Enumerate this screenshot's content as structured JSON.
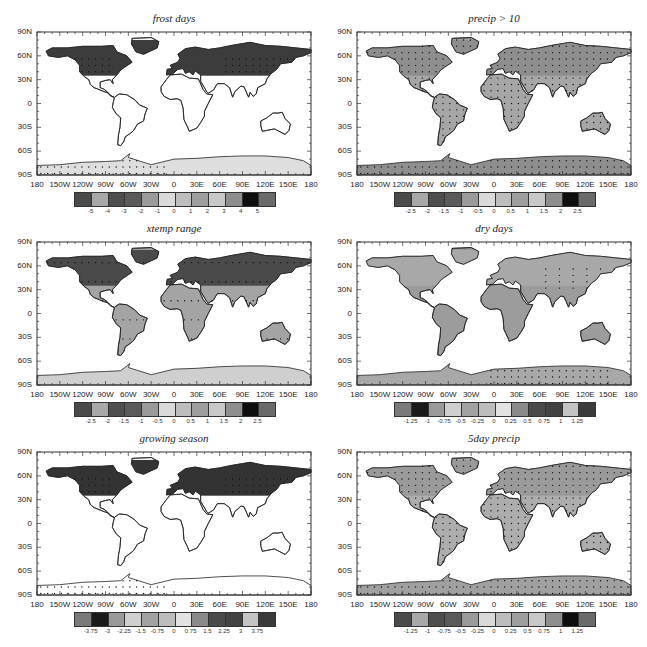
{
  "figure": {
    "lon_ticks": [
      "180",
      "150W",
      "120W",
      "90W",
      "60W",
      "30W",
      "0",
      "30E",
      "60E",
      "90E",
      "120E",
      "150E",
      "180"
    ],
    "lat_ticks": [
      "90N",
      "60N",
      "30N",
      "0",
      "30S",
      "60S",
      "90S"
    ]
  },
  "panels": [
    {
      "id": "frost-days",
      "title": "frost days",
      "cbar_labels": [
        "-5",
        "-4",
        "-3",
        "-2",
        "-1",
        "0",
        "1",
        "2",
        "3",
        "4",
        "5"
      ],
      "cbar_colors": [
        "#4a4a4a",
        "#a8a8a8",
        "#4e4e4e",
        "#5a5a5a",
        "#9a9a9a",
        "#dadada",
        "#bdbdbd",
        "#9e9e9e",
        "#c8c8c8",
        "#8e8e8e",
        "#0e0e0e",
        "#6a6a6a"
      ],
      "land_fill": "#ffffff",
      "nh_fill": "#3c3c3c",
      "stipple": "nh-interior",
      "antarctic_fill": "#dedede"
    },
    {
      "id": "precip-gt-10",
      "title": "precip > 10",
      "cbar_labels": [
        "-2.5",
        "-2",
        "-1.5",
        "-1",
        "-0.5",
        "0",
        "0.5",
        "1",
        "1.5",
        "2",
        "2.5"
      ],
      "cbar_colors": [
        "#4a4a4a",
        "#a8a8a8",
        "#4e4e4e",
        "#5a5a5a",
        "#9a9a9a",
        "#dadada",
        "#bdbdbd",
        "#9e9e9e",
        "#c8c8c8",
        "#8e8e8e",
        "#0e0e0e",
        "#6a6a6a"
      ],
      "land_fill": "#a6a6a6",
      "nh_fill": "#8e8e8e",
      "stipple": "all",
      "antarctic_fill": "#8e8e8e"
    },
    {
      "id": "xtemp-range",
      "title": "xtemp range",
      "cbar_labels": [
        "-2.5",
        "-2",
        "-1.5",
        "-1",
        "-0.5",
        "0",
        "0.5",
        "1",
        "1.5",
        "2",
        "2.5"
      ],
      "cbar_colors": [
        "#4a4a4a",
        "#a8a8a8",
        "#4e4e4e",
        "#5a5a5a",
        "#9a9a9a",
        "#dadada",
        "#bdbdbd",
        "#9e9e9e",
        "#c8c8c8",
        "#8e8e8e",
        "#0e0e0e",
        "#6a6a6a"
      ],
      "land_fill": "#a4a4a4",
      "nh_fill": "#4a4a4a",
      "stipple": "sparse",
      "antarctic_fill": "#cfcfcf"
    },
    {
      "id": "dry-days",
      "title": "dry days",
      "cbar_labels": [
        "-1.25",
        "-1",
        "-0.75",
        "-0.5",
        "-0.25",
        "0",
        "0.25",
        "0.5",
        "0.75",
        "1",
        "1.25"
      ],
      "cbar_colors": [
        "#7a7a7a",
        "#1a1a1a",
        "#9a9a9a",
        "#cfcfcf",
        "#a2a2a2",
        "#bdbdbd",
        "#e2e2e2",
        "#8a8a8a",
        "#4a4a4a",
        "#424242",
        "#c4c4c4",
        "#3a3a3a"
      ],
      "land_fill": "#9c9c9c",
      "nh_fill": "#a8a8a8",
      "stipple": "antarctic",
      "antarctic_fill": "#a8a8a8"
    },
    {
      "id": "growing-season",
      "title": "growing season",
      "cbar_labels": [
        "-3.75",
        "-3",
        "-2.25",
        "-1.5",
        "-0.75",
        "0",
        "0.75",
        "1.5",
        "2.25",
        "3",
        "3.75"
      ],
      "cbar_colors": [
        "#7a7a7a",
        "#1a1a1a",
        "#9a9a9a",
        "#cfcfcf",
        "#a2a2a2",
        "#bdbdbd",
        "#e2e2e2",
        "#8a8a8a",
        "#4a4a4a",
        "#424242",
        "#c4c4c4",
        "#3a3a3a"
      ],
      "land_fill": "#ffffff",
      "nh_fill": "#333333",
      "stipple": "nh-interior",
      "antarctic_fill": "#ffffff"
    },
    {
      "id": "5day-precip",
      "title": "5day precip",
      "cbar_labels": [
        "-1.25",
        "-1",
        "-0.75",
        "-0.5",
        "-0.25",
        "0",
        "0.25",
        "0.5",
        "0.75",
        "1",
        "1.25"
      ],
      "cbar_colors": [
        "#4a4a4a",
        "#a8a8a8",
        "#4e4e4e",
        "#5a5a5a",
        "#9a9a9a",
        "#dadada",
        "#bdbdbd",
        "#9e9e9e",
        "#c8c8c8",
        "#8e8e8e",
        "#0e0e0e",
        "#6a6a6a"
      ],
      "land_fill": "#adadad",
      "nh_fill": "#9a9a9a",
      "stipple": "all",
      "antarctic_fill": "#a0a0a0"
    }
  ],
  "chart_data": [
    {
      "type": "heatmap",
      "title": "frost days",
      "xlabel": "",
      "ylabel": "",
      "x_ticks": [
        "180",
        "150W",
        "120W",
        "90W",
        "60W",
        "30W",
        "0",
        "30E",
        "60E",
        "90E",
        "120E",
        "150E",
        "180"
      ],
      "y_ticks": [
        "90N",
        "60N",
        "30N",
        "0",
        "30S",
        "60S",
        "90S"
      ],
      "colorbar_levels": [
        -5,
        -4,
        -3,
        -2,
        -1,
        0,
        1,
        2,
        3,
        4,
        5
      ],
      "legend_position": "bottom",
      "notes": "Strong negative change over N. America and Eurasia (dark), stippling over Canada/Siberia interior and W. Antarctica"
    },
    {
      "type": "heatmap",
      "title": "precip > 10",
      "x_ticks": [
        "180",
        "150W",
        "120W",
        "90W",
        "60W",
        "30W",
        "0",
        "30E",
        "60E",
        "90E",
        "120E",
        "150E",
        "180"
      ],
      "y_ticks": [
        "90N",
        "60N",
        "30N",
        "0",
        "30S",
        "60S",
        "90S"
      ],
      "colorbar_levels": [
        -2.5,
        -2,
        -1.5,
        -1,
        -0.5,
        0,
        0.5,
        1,
        1.5,
        2,
        2.5
      ],
      "legend_position": "bottom",
      "notes": "Mostly mild positive change, stippling over most land"
    },
    {
      "type": "heatmap",
      "title": "xtemp range",
      "x_ticks": [
        "180",
        "150W",
        "120W",
        "90W",
        "60W",
        "30W",
        "0",
        "30E",
        "60E",
        "90E",
        "120E",
        "150E",
        "180"
      ],
      "y_ticks": [
        "90N",
        "60N",
        "30N",
        "0",
        "30S",
        "60S",
        "90S"
      ],
      "colorbar_levels": [
        -2.5,
        -2,
        -1.5,
        -1,
        -0.5,
        0,
        0.5,
        1,
        1.5,
        2,
        2.5
      ],
      "legend_position": "bottom",
      "notes": "Negative over high northern latitudes, sparse stippling"
    },
    {
      "type": "heatmap",
      "title": "dry days",
      "x_ticks": [
        "180",
        "150W",
        "120W",
        "90W",
        "60W",
        "30W",
        "0",
        "30E",
        "60E",
        "90E",
        "120E",
        "150E",
        "180"
      ],
      "y_ticks": [
        "90N",
        "60N",
        "30N",
        "0",
        "30S",
        "60S",
        "90S"
      ],
      "colorbar_levels": [
        -1.25,
        -1,
        -0.75,
        -0.5,
        -0.25,
        0,
        0.25,
        0.5,
        0.75,
        1,
        1.25
      ],
      "legend_position": "bottom",
      "notes": "Positive over Mediterranean, Amazon, S. Africa; stippling over E. Antarctica"
    },
    {
      "type": "heatmap",
      "title": "growing season",
      "x_ticks": [
        "180",
        "150W",
        "120W",
        "90W",
        "60W",
        "30W",
        "0",
        "30E",
        "60E",
        "90E",
        "120E",
        "150E",
        "180"
      ],
      "y_ticks": [
        "90N",
        "60N",
        "30N",
        "0",
        "30S",
        "60S",
        "90S"
      ],
      "colorbar_levels": [
        -3.75,
        -3,
        -2.25,
        -1.5,
        -0.75,
        0,
        0.75,
        1.5,
        2.25,
        3,
        3.75
      ],
      "legend_position": "bottom",
      "notes": "Large positive change over N. America and Eurasia extratropics, stippled"
    },
    {
      "type": "heatmap",
      "title": "5day precip",
      "x_ticks": [
        "180",
        "150W",
        "120W",
        "90W",
        "60W",
        "30W",
        "0",
        "30E",
        "60E",
        "90E",
        "120E",
        "150E",
        "180"
      ],
      "y_ticks": [
        "90N",
        "60N",
        "30N",
        "0",
        "30S",
        "60S",
        "90S"
      ],
      "colorbar_levels": [
        -1.25,
        -1,
        -0.75,
        -0.5,
        -0.25,
        0,
        0.25,
        0.5,
        0.75,
        1,
        1.25
      ],
      "legend_position": "bottom",
      "notes": "Mild positive change over most land, stippled widely"
    }
  ]
}
